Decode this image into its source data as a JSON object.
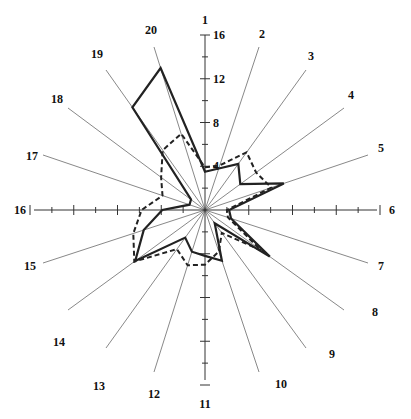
{
  "chart_data": {
    "type": "radar",
    "title": "",
    "categories": [
      "1",
      "2",
      "3",
      "4",
      "5",
      "6",
      "7",
      "8",
      "9",
      "10",
      "11",
      "12",
      "13",
      "14",
      "15",
      "16",
      "17",
      "18",
      "19",
      "20"
    ],
    "radial_ticks": [
      4,
      8,
      12,
      16
    ],
    "radial_tick_labels": [
      "4",
      "8",
      "12",
      "16"
    ],
    "rlim": [
      0,
      16
    ],
    "series": [
      {
        "name": "solid",
        "style": "solid",
        "values": [
          3.5,
          4.0,
          5.2,
          4.0,
          7.6,
          2.2,
          2.5,
          7.3,
          1.5,
          4.9,
          4.2,
          4.0,
          3.1,
          7.9,
          5.9,
          3.9,
          1.5,
          1.6,
          11.5,
          13.6
        ]
      },
      {
        "name": "dashed",
        "style": "dashed",
        "values": [
          3.9,
          4.3,
          6.5,
          5.8,
          6.4,
          2.0,
          2.2,
          6.3,
          2.6,
          4.0,
          5.0,
          5.3,
          4.4,
          8.0,
          6.9,
          5.8,
          4.1,
          5.0,
          6.7,
          7.3
        ]
      }
    ],
    "grid": false,
    "legend": null
  }
}
